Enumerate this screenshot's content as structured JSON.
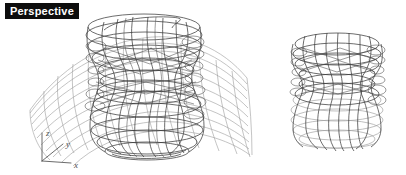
{
  "viewport": {
    "label": "Perspective",
    "label_bg_color": "#0d0d0d",
    "label_text_color": "#ffffff",
    "background_color": "#ffffff",
    "width": 406,
    "height": 175
  },
  "axis_gizmo": {
    "name": "world-axis-indicator",
    "origin": {
      "x": 42,
      "y": 161
    },
    "color": "#5a5a5a",
    "axes": [
      {
        "id": "z",
        "label": "z",
        "end_x": 42,
        "end_y": 133,
        "label_x": 46,
        "label_y": 133
      },
      {
        "id": "y",
        "label": "y",
        "end_x": 63,
        "end_y": 144,
        "label_x": 66,
        "label_y": 145
      },
      {
        "id": "x",
        "label": "x",
        "end_x": 71,
        "end_y": 163,
        "label_x": 74,
        "label_y": 167
      }
    ]
  },
  "objects": [
    {
      "name": "left-composite-object",
      "description": "lobed revolved vase wireframe intersecting a curved saddle surface mesh",
      "parts": [
        "vase-wireframe",
        "surface-mesh"
      ],
      "line_color_dark": "#3a3a3a",
      "line_color_light": "#9a9a9a",
      "bounds": {
        "x": 28,
        "y": 12,
        "width": 220,
        "height": 145
      }
    },
    {
      "name": "right-vase-object",
      "description": "trimmed lobed revolved vase wireframe shown alone",
      "parts": [
        "vase-wireframe"
      ],
      "line_color_dark": "#3a3a3a",
      "line_color_light": "#9a9a9a",
      "bounds": {
        "x": 280,
        "y": 32,
        "width": 115,
        "height": 118
      }
    }
  ],
  "render": {
    "mode": "wireframe",
    "projection": "perspective"
  }
}
